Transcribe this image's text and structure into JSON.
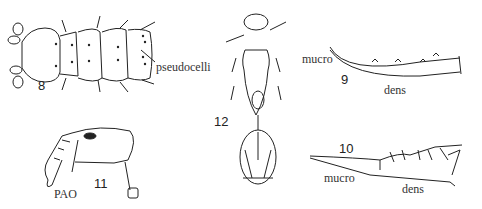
{
  "figures": [
    {
      "number": "8",
      "labels": [
        "pseudocelli"
      ]
    },
    {
      "number": "9",
      "labels": [
        "mucro",
        "dens"
      ]
    },
    {
      "number": "10",
      "labels": [
        "mucro",
        "dens"
      ]
    },
    {
      "number": "11",
      "labels": [
        "PAO"
      ]
    },
    {
      "number": "12",
      "labels": []
    }
  ]
}
